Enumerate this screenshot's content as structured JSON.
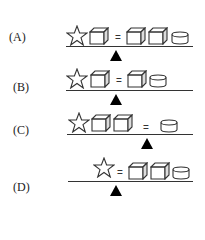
{
  "options": [
    {
      "label": "(A)",
      "left": [
        "star",
        "cube"
      ],
      "right": [
        "cube",
        "cube",
        "cylinder"
      ],
      "equals": "="
    },
    {
      "label": "(B)",
      "left": [
        "star",
        "cube"
      ],
      "right": [
        "cube",
        "cylinder"
      ],
      "equals": "="
    },
    {
      "label": "(C)",
      "left": [
        "star",
        "cube",
        "cube"
      ],
      "right": [
        "cylinder"
      ],
      "equals": "="
    },
    {
      "label": "(D)",
      "left": [
        "star"
      ],
      "right": [
        "cube",
        "cube",
        "cylinder"
      ],
      "equals": "="
    }
  ],
  "icons": {
    "star": "star-icon",
    "cube": "cube-icon",
    "cylinder": "cylinder-icon",
    "fulcrum": "triangle-fulcrum-icon"
  },
  "colors": {
    "stroke": "#333333",
    "fulcrum": "#000000",
    "background": "#ffffff"
  }
}
